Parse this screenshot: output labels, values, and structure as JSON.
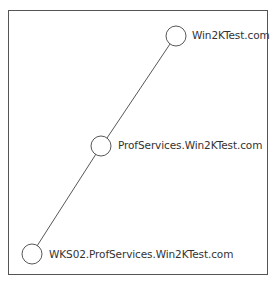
{
  "diagram": {
    "type": "domain-tree",
    "nodes": [
      {
        "id": "root",
        "label": "Win2KTest.com"
      },
      {
        "id": "child",
        "label": "ProfServices.Win2KTest.com"
      },
      {
        "id": "grandchild",
        "label": "WKS02.ProfServices.Win2KTest.com"
      }
    ],
    "edges": [
      {
        "from": "root",
        "to": "child"
      },
      {
        "from": "child",
        "to": "grandchild"
      }
    ]
  }
}
